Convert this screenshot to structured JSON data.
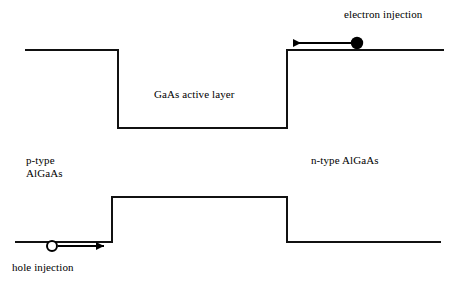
{
  "diagram": {
    "stroke_color": "#111111",
    "background_color": "#ffffff",
    "labels": {
      "electron_injection": "electron injection",
      "gaas_active_layer": "GaAs active layer",
      "ptype_algaas_line1": "p-type",
      "ptype_algaas_line2": "AlGaAs",
      "ntype_algaas": "n-type AlGaAs",
      "hole_injection": "hole injection"
    },
    "conduction_band": {
      "name": "conduction-band-profile",
      "left_plateau_y": 50,
      "well_bottom_y": 128,
      "right_plateau_y": 50,
      "left_start_x": 26,
      "left_step_x": 118,
      "right_step_x": 287,
      "right_end_x": 443
    },
    "valence_band": {
      "name": "valence-band-profile",
      "left_plateau_y": 242,
      "barrier_top_y": 197,
      "right_plateau_y": 242,
      "left_start_x": 16,
      "left_step_x": 112,
      "right_step_x": 287,
      "right_end_x": 440
    },
    "electron_carrier": {
      "type": "filled-circle",
      "cx": 357,
      "cy": 43,
      "r": 6,
      "fill": "#000000",
      "arrow_direction": "left",
      "arrow_from_x": 351,
      "arrow_to_x": 291,
      "arrow_y": 43
    },
    "hole_carrier": {
      "type": "open-circle",
      "cx": 52,
      "cy": 246,
      "r": 5,
      "fill": "#ffffff",
      "arrow_direction": "right",
      "arrow_from_x": 58,
      "arrow_to_x": 106,
      "arrow_y": 246
    }
  }
}
